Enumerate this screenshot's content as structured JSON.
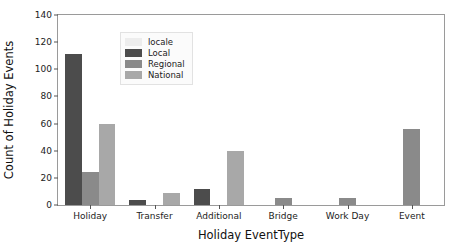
{
  "chart_data": {
    "type": "bar",
    "title": "",
    "xlabel": "Holiday EventType",
    "ylabel": "Count of Holiday Events",
    "categories": [
      "Holiday",
      "Transfer",
      "Additional",
      "Bridge",
      "Work Day",
      "Event"
    ],
    "series": [
      {
        "name": "Local",
        "color": "#4c4c4c",
        "values": [
          111,
          4,
          12,
          0,
          0,
          0
        ]
      },
      {
        "name": "Regional",
        "color": "#8a8a8a",
        "values": [
          24,
          0,
          0,
          5,
          5,
          56
        ]
      },
      {
        "name": "National",
        "color": "#a8a8a8",
        "values": [
          60,
          9,
          40,
          0,
          0,
          0
        ]
      }
    ],
    "legend": {
      "title": "locale",
      "title_swatch_color": "#ededed",
      "position": "upper-left",
      "entries": [
        {
          "label": "Local",
          "color": "#4c4c4c"
        },
        {
          "label": "Regional",
          "color": "#8a8a8a"
        },
        {
          "label": "National",
          "color": "#a8a8a8"
        }
      ]
    },
    "ylim": [
      0,
      140
    ],
    "yticks": [
      0,
      20,
      40,
      60,
      80,
      100,
      120,
      140
    ],
    "grid": false,
    "background": "#ffffff",
    "axes_edge_color": "#9a9a9a"
  }
}
